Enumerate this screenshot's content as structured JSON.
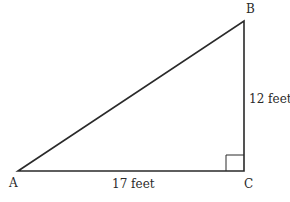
{
  "diagram": {
    "type": "right-triangle",
    "vertices": {
      "A": {
        "label": "A",
        "x": 18,
        "y": 171
      },
      "B": {
        "label": "B",
        "x": 244,
        "y": 21
      },
      "C": {
        "label": "C",
        "x": 244,
        "y": 171
      }
    },
    "right_angle_at": "C",
    "sides": {
      "AC": {
        "label": "17 feet"
      },
      "BC": {
        "label": "12 feet"
      }
    },
    "line_color": "#2a2a2a"
  }
}
